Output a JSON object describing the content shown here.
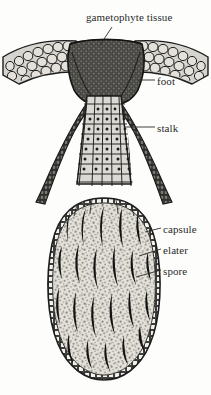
{
  "figure": {
    "background_color": "#fdfdfb",
    "ink_color": "#1d1d1d",
    "tissue_fill": "#d8d6d0",
    "dark_fill": "#3a3a38",
    "capsule_fill": "#dedcd4",
    "spore_color": "#8e8c84",
    "width": 211,
    "height": 395
  },
  "labels": {
    "gametophyte_tissue": "gametophyte tissue",
    "foot": "foot",
    "stalk": "stalk",
    "capsule": "capsule",
    "elater": "elater",
    "spore": "spore"
  },
  "structures": [
    {
      "name": "gametophyte-tissue",
      "label": "gametophyte tissue",
      "description": "wing-like collar of large rounded cells flanking the top of the sporophyte",
      "leader_from": [
        113,
        26
      ],
      "leader_to": [
        101,
        44
      ]
    },
    {
      "name": "foot",
      "label": "foot",
      "description": "dark mass of small cells anchoring the sporophyte into the gametophyte",
      "leader_from": [
        155,
        80
      ],
      "leader_to": [
        132,
        80
      ]
    },
    {
      "name": "stalk",
      "label": "stalk",
      "description": "seta of vertically elongated nucleated cells connecting foot to capsule",
      "leader_from": [
        155,
        127
      ],
      "leader_to": [
        123,
        127
      ]
    },
    {
      "name": "capsule",
      "label": "capsule",
      "description": "ovoid sporangium with a single-cell-layer wall",
      "leader_from": [
        161,
        228
      ],
      "leader_to": [
        142,
        231
      ]
    },
    {
      "name": "elater",
      "label": "elater",
      "description": "dark elongated spindle-shaped cells among the spores",
      "leader_from": [
        161,
        249
      ],
      "leader_to": [
        136,
        255
      ]
    },
    {
      "name": "spore",
      "label": "spore",
      "description": "small stippled dots filling the capsule interior",
      "leader_from": [
        161,
        270
      ],
      "leader_to": [
        133,
        276
      ]
    }
  ]
}
